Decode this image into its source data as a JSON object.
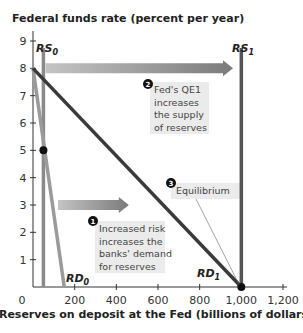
{
  "chart_data": {
    "type": "line",
    "title": "",
    "ylabel": "Federal funds rate (percent per year)",
    "xlabel": "Reserves on deposit at the Fed (billions of dollars)",
    "xlim": [
      0,
      1200
    ],
    "ylim": [
      0,
      9
    ],
    "x_ticks": [
      0,
      200,
      400,
      600,
      800,
      1000,
      1200
    ],
    "x_tick_labels": [
      "0",
      "200",
      "400",
      "600",
      "800",
      "1,000",
      "1,200"
    ],
    "y_ticks": [
      1,
      2,
      3,
      4,
      5,
      6,
      7,
      8,
      9
    ],
    "y_tick_labels": [
      "1",
      "2",
      "3",
      "4",
      "5",
      "6",
      "7",
      "8",
      "9"
    ],
    "grid": false,
    "series": [
      {
        "name": "RS0",
        "label_main": "RS",
        "label_sub": "0",
        "kind": "vertical",
        "x": 50,
        "y_range": [
          0,
          9
        ],
        "color": "#8a8a8a"
      },
      {
        "name": "RS1",
        "label_main": "RS",
        "label_sub": "1",
        "kind": "vertical",
        "x": 1000,
        "y_range": [
          0,
          9
        ],
        "color": "#555555"
      },
      {
        "name": "RD0",
        "label_main": "RD",
        "label_sub": "0",
        "kind": "line",
        "points": [
          [
            0,
            8
          ],
          [
            150,
            0
          ]
        ],
        "color": "#9a9a9a"
      },
      {
        "name": "RD1",
        "label_main": "RD",
        "label_sub": "1",
        "kind": "line",
        "points": [
          [
            0,
            8
          ],
          [
            1000,
            0
          ]
        ],
        "color": "#3a3a3a"
      }
    ],
    "points": [
      {
        "name": "initial-equilibrium",
        "x": 50,
        "y": 5
      },
      {
        "name": "new-equilibrium",
        "x": 1000,
        "y": 0
      }
    ],
    "arrows": [
      {
        "name": "supply-shift-arrow",
        "from": [
          60,
          8
        ],
        "to": [
          960,
          8
        ]
      },
      {
        "name": "demand-shift-arrow",
        "from": [
          120,
          3
        ],
        "to": [
          460,
          3
        ]
      }
    ],
    "annotations": [
      {
        "number": "1",
        "lines": [
          "Increased risk",
          "increases the",
          "banks' demand",
          "for reserves"
        ]
      },
      {
        "number": "2",
        "lines": [
          "Fed's QE1",
          "increases",
          "the supply",
          "of reserves"
        ]
      },
      {
        "number": "3",
        "lines": [
          "Equilibrium"
        ]
      }
    ]
  }
}
